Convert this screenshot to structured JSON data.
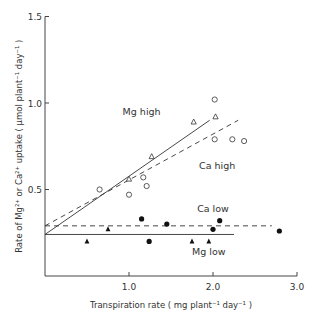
{
  "chart_data": {
    "type": "scatter",
    "title": "",
    "xlabel": "Transpiration rate ( mg plant⁻¹ day⁻¹ )",
    "ylabel": "Rate of Mg²⁺ or Ca²⁺ uptake ( µmol plant⁻¹ day⁻¹ )",
    "xlim": [
      0,
      3.0
    ],
    "ylim": [
      0,
      1.5
    ],
    "xticks": [
      "1.0",
      "2.0",
      "3.0"
    ],
    "yticks": [
      "0.5",
      "1.0",
      "1.5"
    ],
    "grid": false,
    "legend": "inline labels",
    "series": [
      {
        "name": "Mg high",
        "marker": "open-triangle",
        "points": [
          [
            1.0,
            0.56
          ],
          [
            1.27,
            0.69
          ],
          [
            1.77,
            0.89
          ],
          [
            2.03,
            0.92
          ]
        ],
        "fit": {
          "style": "solid",
          "x": [
            0,
            1.96
          ],
          "y": [
            0.24,
            0.9
          ]
        }
      },
      {
        "name": "Ca high",
        "marker": "open-circle",
        "points": [
          [
            0.65,
            0.5
          ],
          [
            1.0,
            0.47
          ],
          [
            1.17,
            0.57
          ],
          [
            1.21,
            0.52
          ],
          [
            2.02,
            1.02
          ],
          [
            2.02,
            0.79
          ],
          [
            2.23,
            0.79
          ],
          [
            2.37,
            0.78
          ]
        ],
        "fit": {
          "style": "dashed",
          "x": [
            0,
            2.3
          ],
          "y": [
            0.29,
            0.9
          ]
        }
      },
      {
        "name": "Ca low",
        "marker": "filled-circle",
        "points": [
          [
            1.15,
            0.33
          ],
          [
            1.24,
            0.2
          ],
          [
            1.45,
            0.3
          ],
          [
            2.0,
            0.27
          ],
          [
            2.08,
            0.32
          ],
          [
            2.79,
            0.26
          ]
        ],
        "fit": {
          "style": "dashed",
          "x": [
            0,
            2.7
          ],
          "y": [
            0.29,
            0.29
          ]
        }
      },
      {
        "name": "Mg low",
        "marker": "filled-triangle",
        "points": [
          [
            0.5,
            0.2
          ],
          [
            0.75,
            0.27
          ],
          [
            1.75,
            0.2
          ],
          [
            1.95,
            0.2
          ]
        ],
        "fit": {
          "style": "solid",
          "x": [
            0,
            2.25
          ],
          "y": [
            0.24,
            0.24
          ]
        }
      }
    ],
    "annotations": [
      {
        "text": "Mg high",
        "x": 1.15,
        "y": 0.93
      },
      {
        "text": "Ca high",
        "x": 2.05,
        "y": 0.62
      },
      {
        "text": "Ca low",
        "x": 2.0,
        "y": 0.37
      },
      {
        "text": "Mg low",
        "x": 1.95,
        "y": 0.12
      }
    ]
  }
}
